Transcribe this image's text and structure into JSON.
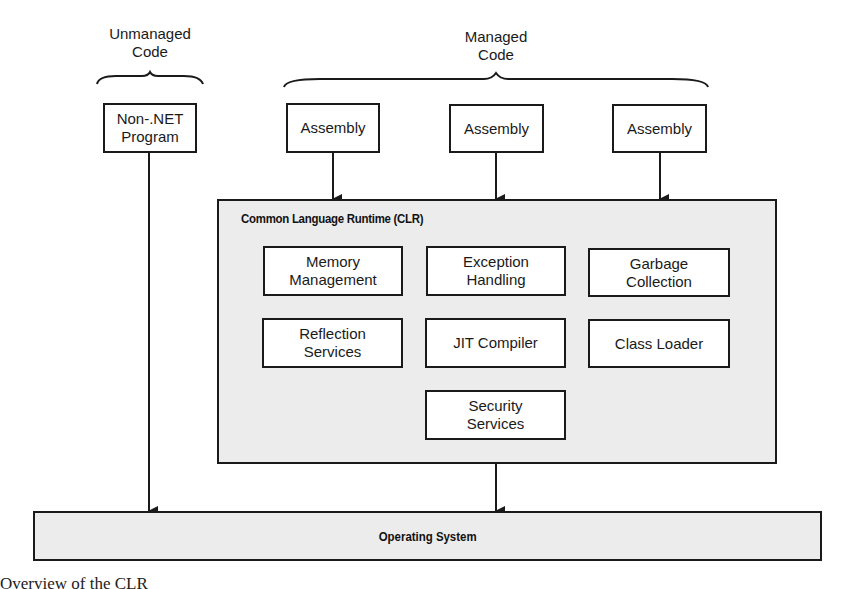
{
  "groups": {
    "unmanaged": {
      "label": "Unmanaged\nCode"
    },
    "managed": {
      "label": "Managed\nCode"
    }
  },
  "unmanaged_program": {
    "label": "Non-.NET\nProgram"
  },
  "assemblies": [
    {
      "label": "Assembly"
    },
    {
      "label": "Assembly"
    },
    {
      "label": "Assembly"
    }
  ],
  "clr": {
    "title": "Common Language Runtime (CLR)",
    "components": [
      {
        "label": "Memory\nManagement"
      },
      {
        "label": "Exception\nHandling"
      },
      {
        "label": "Garbage\nCollection"
      },
      {
        "label": "Reflection\nServices"
      },
      {
        "label": "JIT Compiler"
      },
      {
        "label": "Class Loader"
      },
      {
        "label": "Security\nServices"
      }
    ]
  },
  "os": {
    "label": "Operating System"
  },
  "caption": "Overview of the CLR"
}
